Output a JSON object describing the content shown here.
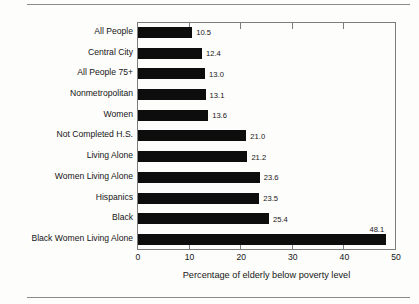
{
  "chart_data": {
    "type": "bar",
    "orientation": "horizontal",
    "title": "",
    "xlabel": "Percentage of elderly below poverty level",
    "ylabel": "",
    "xlim": [
      0,
      50
    ],
    "xticks": [
      "0",
      "10",
      "20",
      "30",
      "40",
      "50"
    ],
    "grid": false,
    "legend": false,
    "bar_color": "#0d0d0d",
    "categories": [
      "All People",
      "Central City",
      "All People 75+",
      "Nonmetropolitan",
      "Women",
      "Not Completed H.S.",
      "Living Alone",
      "Women Living Alone",
      "Hispanics",
      "Black",
      "Black Women Living Alone"
    ],
    "values": [
      10.5,
      12.4,
      13.0,
      13.1,
      13.6,
      21.0,
      21.2,
      23.6,
      23.5,
      25.4,
      48.1
    ],
    "value_labels": [
      "10.5",
      "12.4",
      "13.0",
      "13.1",
      "13.6",
      "21.0",
      "21.2",
      "23.6",
      "23.5",
      "25.4",
      "48.1"
    ]
  }
}
